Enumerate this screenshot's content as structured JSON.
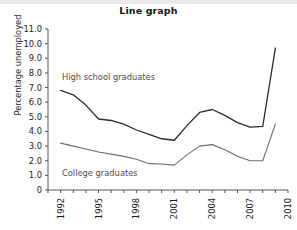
{
  "chart_data": {
    "type": "line",
    "title": "Line graph",
    "xlabel": "",
    "ylabel": "Percentage unemployed",
    "x": [
      1992,
      1993,
      1994,
      1995,
      1996,
      1997,
      1998,
      1999,
      2000,
      2001,
      2002,
      2003,
      2004,
      2005,
      2006,
      2007,
      2008,
      2009
    ],
    "xlim": [
      1991,
      2010
    ],
    "ylim": [
      0,
      11
    ],
    "grid": false,
    "legend_position": "inline-annotation",
    "x_tick_labels": [
      "1992",
      "1995",
      "1998",
      "2001",
      "2004",
      "2007",
      "2010"
    ],
    "x_tick_values": [
      1992,
      1995,
      1998,
      2001,
      2004,
      2007,
      2010
    ],
    "x_minor_tick_values": [
      1991,
      1992,
      1993,
      1994,
      1995,
      1996,
      1997,
      1998,
      1999,
      2000,
      2001,
      2002,
      2003,
      2004,
      2005,
      2006,
      2007,
      2008,
      2009,
      2010
    ],
    "y_tick_labels": [
      "0",
      "1.0",
      "2.0",
      "3.0",
      "4.0",
      "5.0",
      "6.0",
      "7.0",
      "8.0",
      "9.0",
      "10.0",
      "11.0"
    ],
    "y_tick_values": [
      0,
      1,
      2,
      3,
      4,
      5,
      6,
      7,
      8,
      9,
      10,
      11
    ],
    "series": [
      {
        "name": "High school graduates",
        "color": "#2b2b2b",
        "annotation_label": "High school graduates",
        "values": [
          6.8,
          6.5,
          5.8,
          4.85,
          4.75,
          4.5,
          4.1,
          3.8,
          3.5,
          3.4,
          4.4,
          5.3,
          5.5,
          5.1,
          4.6,
          4.3,
          4.35,
          9.7
        ]
      },
      {
        "name": "College graduates",
        "color": "#6d6d6d",
        "annotation_label": "College graduates",
        "values": [
          3.2,
          3.0,
          2.8,
          2.6,
          2.45,
          2.3,
          2.1,
          1.8,
          1.78,
          1.7,
          2.4,
          3.0,
          3.1,
          2.75,
          2.3,
          2.0,
          2.0,
          4.5
        ]
      }
    ]
  }
}
